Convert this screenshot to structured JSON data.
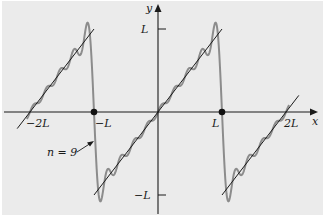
{
  "figure": {
    "axis_labels": {
      "x": "x",
      "y": "y"
    },
    "x_ticks": [
      {
        "value": -2,
        "label": "−2L"
      },
      {
        "value": -1,
        "label": "−L"
      },
      {
        "value": 1,
        "label": "L"
      },
      {
        "value": 2,
        "label": "2L"
      }
    ],
    "y_ticks": [
      {
        "value": 1,
        "label": "L"
      },
      {
        "value": -1,
        "label": "−L"
      }
    ],
    "annotation": {
      "text": "n = 9"
    },
    "function": "f(x) = x on (−L, L), periodic with period 2L",
    "series": [
      {
        "name": "sawtooth f(x)",
        "role": "exact function",
        "color": "#1a1a1a"
      },
      {
        "name": "Fourier partial sum",
        "terms": 9,
        "color": "#8c8c8c"
      }
    ],
    "discontinuity_points": [
      -1,
      1
    ],
    "x_range": [
      -2.5,
      2.5
    ],
    "y_range": [
      -1.1,
      1.1
    ]
  }
}
